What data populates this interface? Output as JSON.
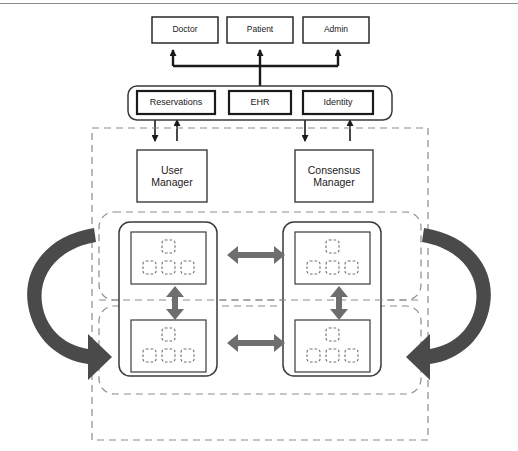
{
  "diagram": {
    "background_color": "#ffffff",
    "stroke_color": "#1a1a1a",
    "arrow_gray": "#6e6e6e",
    "dashed_gray": "#8c8c8c",
    "actors": [
      {
        "label": "Doctor",
        "x": 152,
        "y": 17,
        "w": 66,
        "h": 26
      },
      {
        "label": "Patient",
        "x": 227,
        "y": 17,
        "w": 66,
        "h": 26
      },
      {
        "label": "Admin",
        "x": 303,
        "y": 17,
        "w": 66,
        "h": 26
      }
    ],
    "services_container": {
      "x": 128,
      "y": 86,
      "w": 264,
      "h": 34,
      "radius": 9
    },
    "services": [
      {
        "label": "Reservations",
        "x": 137,
        "y": 91,
        "w": 78,
        "h": 23
      },
      {
        "label": "EHR",
        "x": 229,
        "y": 91,
        "w": 62,
        "h": 23
      },
      {
        "label": "Identity",
        "x": 303,
        "y": 91,
        "w": 70,
        "h": 23
      }
    ],
    "network_boundary": {
      "x": 92,
      "y": 128,
      "w": 336,
      "h": 312
    },
    "managers": [
      {
        "label": "User\nManager",
        "x": 137,
        "y": 150,
        "w": 70,
        "h": 52
      },
      {
        "label": "Consensus\nManager",
        "x": 295,
        "y": 150,
        "w": 78,
        "h": 52
      }
    ],
    "peer_groups": [
      {
        "name": "peer-group-top",
        "x": 99,
        "y": 212,
        "w": 322,
        "h": 88,
        "radius": 14
      },
      {
        "name": "peer-group-bottom",
        "x": 99,
        "y": 306,
        "w": 322,
        "h": 88,
        "radius": 14
      }
    ],
    "nodes": [
      {
        "name": "node-top-left",
        "x": 119,
        "y": 222,
        "w": 98,
        "h": 154
      },
      {
        "name": "node-top-right",
        "x": 283,
        "y": 222,
        "w": 98,
        "h": 154
      },
      {
        "name": "node-bottom-left",
        "x": 119,
        "y": 310,
        "w": 98,
        "h": 72
      },
      {
        "name": "node-bottom-right",
        "x": 283,
        "y": 310,
        "w": 98,
        "h": 72
      }
    ],
    "ledger_boxes": [
      {
        "name": "ledger-top-left",
        "x": 131,
        "y": 232,
        "w": 75,
        "h": 52
      },
      {
        "name": "ledger-top-right",
        "x": 295,
        "y": 232,
        "w": 75,
        "h": 52
      },
      {
        "name": "ledger-bottom-left",
        "x": 131,
        "y": 320,
        "w": 75,
        "h": 52
      },
      {
        "name": "ledger-bottom-right",
        "x": 295,
        "y": 320,
        "w": 75,
        "h": 52
      }
    ],
    "block_layout": {
      "description": "four dashed rounded squares per ledger: one centered on top row, three on bottom row",
      "size": 13,
      "top_offsets": [
        31
      ],
      "bottom_offsets": [
        12,
        31,
        50
      ],
      "top_row_dy": 8,
      "bottom_row_dy": 29
    },
    "sync_arrows": [
      {
        "name": "horizontal-sync-top",
        "orientation": "horizontal",
        "double_headed": true
      },
      {
        "name": "horizontal-sync-bottom",
        "orientation": "horizontal",
        "double_headed": true
      },
      {
        "name": "vertical-sync-left",
        "orientation": "vertical",
        "double_headed": true
      },
      {
        "name": "vertical-sync-right",
        "orientation": "vertical",
        "double_headed": true
      }
    ],
    "feed_arrows": [
      {
        "name": "feed-arrow-left",
        "direction": "up"
      },
      {
        "name": "feed-arrow-right",
        "direction": "up"
      }
    ],
    "replication_arrows": [
      {
        "name": "replication-arrow-left",
        "side": "left",
        "direction": "clockwise-down"
      },
      {
        "name": "replication-arrow-right",
        "side": "right",
        "direction": "counterclockwise-down"
      }
    ],
    "service_links": [
      {
        "name": "link-ehr-to-actors-trunk"
      },
      {
        "name": "link-bus-to-doctor"
      },
      {
        "name": "link-bus-to-patient"
      },
      {
        "name": "link-bus-to-admin"
      },
      {
        "name": "link-usermanager-down"
      },
      {
        "name": "link-reservations-up"
      },
      {
        "name": "link-consensusmanager-down"
      },
      {
        "name": "link-identity-up"
      }
    ]
  }
}
